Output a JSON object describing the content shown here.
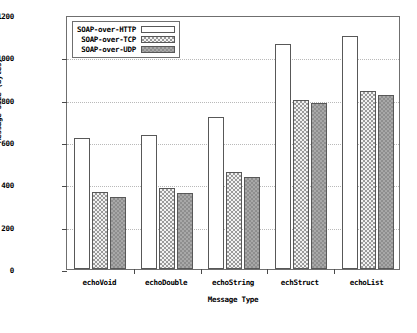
{
  "chart_data": {
    "type": "bar",
    "title": "",
    "xlabel": "Message Type",
    "ylabel": "Message Size (bytes)",
    "categories": [
      "echoVoid",
      "echoDouble",
      "echoString",
      "echStruct",
      "echoList"
    ],
    "series": [
      {
        "name": "SOAP-over-HTTP",
        "values": [
          617,
          634,
          716,
          1065,
          1100
        ],
        "swatch": "white-empty"
      },
      {
        "name": "SOAP-over-TCP",
        "values": [
          365,
          382,
          458,
          800,
          843
        ],
        "swatch": "light-hatch"
      },
      {
        "name": "SOAP-over-UDP",
        "values": [
          340,
          358,
          437,
          785,
          820
        ],
        "swatch": "dark-hatch"
      }
    ],
    "ylim": [
      0,
      1200
    ],
    "yticks": [
      0,
      200,
      400,
      600,
      800,
      1000,
      1200
    ],
    "ytick_labels": [
      "0",
      "200",
      "400",
      "600",
      "800",
      "1000",
      "1200"
    ],
    "grid": true,
    "legend_position": "top-left"
  },
  "caption": ""
}
